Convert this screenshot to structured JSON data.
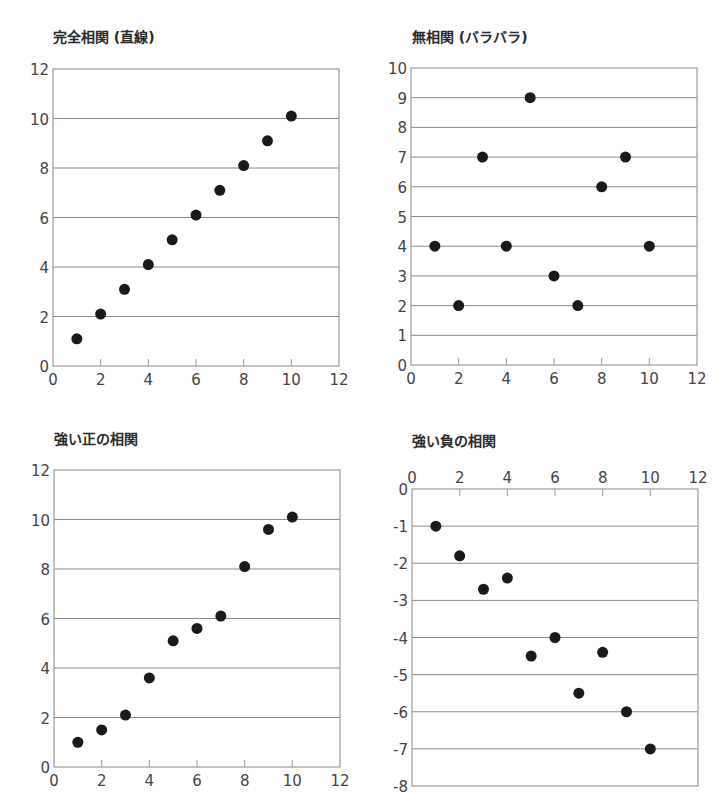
{
  "colors": {
    "frame": "#9a9a9a",
    "grid": "#8a8a8a",
    "point": "#1a1a1a",
    "tick_text": "#444444"
  },
  "chart_data": [
    {
      "id": "perfect",
      "type": "scatter",
      "title": "完全相関 (直線)",
      "xlabel": "",
      "ylabel": "",
      "xlim": [
        0,
        12
      ],
      "ylim": [
        0,
        12
      ],
      "xticks": [
        0,
        2,
        4,
        6,
        8,
        10,
        12
      ],
      "yticks": [
        0,
        2,
        4,
        6,
        8,
        10,
        12
      ],
      "x_axis_position": "bottom",
      "grid": "horizontal",
      "x": [
        1,
        2,
        3,
        4,
        5,
        6,
        7,
        8,
        9,
        10
      ],
      "y": [
        1.1,
        2.1,
        3.1,
        4.1,
        5.1,
        6.1,
        7.1,
        8.1,
        9.1,
        10.1
      ]
    },
    {
      "id": "none",
      "type": "scatter",
      "title": "無相関 (バラバラ)",
      "xlabel": "",
      "ylabel": "",
      "xlim": [
        0,
        12
      ],
      "ylim": [
        0,
        10
      ],
      "xticks": [
        0,
        2,
        4,
        6,
        8,
        10,
        12
      ],
      "yticks": [
        0,
        1,
        2,
        3,
        4,
        5,
        6,
        7,
        8,
        9,
        10
      ],
      "x_axis_position": "bottom",
      "grid": "horizontal",
      "x": [
        1,
        2,
        3,
        4,
        5,
        6,
        7,
        8,
        9,
        10
      ],
      "y": [
        4,
        2,
        7,
        4,
        9,
        3,
        2,
        6,
        7,
        4
      ]
    },
    {
      "id": "strong-positive",
      "type": "scatter",
      "title": "強い正の相関",
      "xlabel": "",
      "ylabel": "",
      "xlim": [
        0,
        12
      ],
      "ylim": [
        0,
        12
      ],
      "xticks": [
        0,
        2,
        4,
        6,
        8,
        10,
        12
      ],
      "yticks": [
        0,
        2,
        4,
        6,
        8,
        10,
        12
      ],
      "x_axis_position": "bottom",
      "grid": "horizontal",
      "x": [
        1,
        2,
        3,
        4,
        5,
        6,
        7,
        8,
        9,
        10
      ],
      "y": [
        1.0,
        1.5,
        2.1,
        3.6,
        5.1,
        5.6,
        6.1,
        8.1,
        9.6,
        10.1
      ]
    },
    {
      "id": "strong-negative",
      "type": "scatter",
      "title": "強い負の相関",
      "xlabel": "",
      "ylabel": "",
      "xlim": [
        0,
        12
      ],
      "ylim": [
        -8,
        0
      ],
      "xticks": [
        0,
        2,
        4,
        6,
        8,
        10,
        12
      ],
      "yticks": [
        0,
        -1,
        -2,
        -3,
        -4,
        -5,
        -6,
        -7,
        -8
      ],
      "x_axis_position": "top",
      "grid": "horizontal",
      "x": [
        1,
        2,
        3,
        4,
        5,
        6,
        7,
        8,
        9,
        10
      ],
      "y": [
        -1.0,
        -1.8,
        -2.7,
        -2.4,
        -4.5,
        -4.0,
        -5.5,
        -4.4,
        -6.0,
        -7.0
      ]
    }
  ],
  "panels": [
    {
      "title": "完全相関 (直線)"
    },
    {
      "title": "無相関 (バラバラ)"
    },
    {
      "title": "強い正の相関"
    },
    {
      "title": "強い負の相関"
    }
  ]
}
